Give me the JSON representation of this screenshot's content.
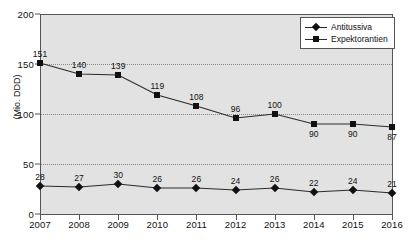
{
  "chart_data": {
    "type": "line",
    "title": "",
    "xlabel": "",
    "ylabel": "(Mio. DDD)",
    "categories": [
      "2007",
      "2008",
      "2009",
      "2010",
      "2011",
      "2012",
      "2013",
      "2014",
      "2015",
      "2016"
    ],
    "ylim": [
      0,
      200
    ],
    "yticks": [
      0,
      50,
      100,
      150,
      200
    ],
    "grid": true,
    "legend_position": "top-right",
    "series": [
      {
        "name": "Antitussiva",
        "marker": "diamond",
        "label_position": "above",
        "values": [
          28,
          27,
          30,
          26,
          26,
          24,
          26,
          22,
          24,
          21
        ]
      },
      {
        "name": "Expektorantien",
        "marker": "square",
        "label_position": [
          "above",
          "above",
          "above",
          "above",
          "above",
          "above",
          "above",
          "below",
          "below",
          "below"
        ],
        "values": [
          151,
          140,
          139,
          119,
          108,
          96,
          100,
          90,
          90,
          87
        ]
      }
    ],
    "colors": {
      "plot_background": "#e2e2e2",
      "line": "#2b2b2b",
      "marker": "#111111",
      "grid": "#8a8a8a",
      "axis": "#555555",
      "legend_background": "#ffffff"
    }
  },
  "legend": {
    "items": [
      {
        "label": "Antitussiva"
      },
      {
        "label": "Expektorantien"
      }
    ]
  },
  "axes": {
    "y_title": "(Mio. DDD)",
    "y_tick_labels": [
      "0",
      "50",
      "100",
      "150",
      "200"
    ],
    "x_tick_labels": [
      "2007",
      "2008",
      "2009",
      "2010",
      "2011",
      "2012",
      "2013",
      "2014",
      "2015",
      "2016"
    ]
  }
}
